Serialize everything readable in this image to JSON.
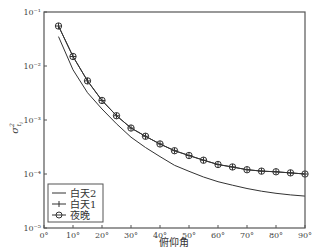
{
  "chart_data": {
    "type": "line",
    "title": "",
    "xlabel": "俯仰角",
    "ylabel": "σ²_{t_i}",
    "yscale": "log",
    "xlim": [
      0,
      90
    ],
    "ylim": [
      1e-05,
      0.1
    ],
    "x_ticks": [
      0,
      10,
      20,
      30,
      40,
      50,
      60,
      70,
      80,
      90
    ],
    "x_tick_labels": [
      "0°",
      "10°",
      "20°",
      "30°",
      "40°",
      "50°",
      "60°",
      "70°",
      "80°",
      "90°"
    ],
    "y_ticks": [
      0.1,
      0.01,
      0.001,
      0.0001,
      1e-05
    ],
    "y_tick_labels": [
      "10⁻¹",
      "10⁻²",
      "10⁻³",
      "10⁻⁴",
      "10⁻⁵"
    ],
    "grid": false,
    "legend_position": "lower left",
    "x": [
      5,
      10,
      15,
      20,
      25,
      30,
      35,
      40,
      45,
      50,
      55,
      60,
      65,
      70,
      75,
      80,
      85,
      90
    ],
    "series": [
      {
        "name": "白天2",
        "marker": "none",
        "values": [
          0.035,
          0.0085,
          0.0032,
          0.0016,
          0.00085,
          0.00048,
          0.00031,
          0.00021,
          0.000145,
          0.000112,
          8.8e-05,
          7.2e-05,
          6.2e-05,
          5.4e-05,
          4.8e-05,
          4.4e-05,
          4.1e-05,
          3.9e-05
        ]
      },
      {
        "name": "白天1",
        "marker": "plus",
        "values": [
          0.055,
          0.015,
          0.0053,
          0.0023,
          0.0012,
          0.00071,
          0.0005,
          0.00036,
          0.00027,
          0.00022,
          0.00018,
          0.00015,
          0.000135,
          0.00012,
          0.000113,
          0.00011,
          0.000105,
          0.0001
        ]
      },
      {
        "name": "夜晚",
        "marker": "circle",
        "values": [
          0.055,
          0.015,
          0.0053,
          0.0023,
          0.0012,
          0.00071,
          0.0005,
          0.00036,
          0.00027,
          0.00022,
          0.00018,
          0.00015,
          0.000135,
          0.00012,
          0.000113,
          0.00011,
          0.000105,
          0.0001
        ]
      }
    ]
  },
  "legend": {
    "items": [
      {
        "label": "白天2",
        "symbol": "line"
      },
      {
        "label": "白天1",
        "symbol": "plus"
      },
      {
        "label": "夜晚",
        "symbol": "circle"
      }
    ]
  },
  "axes": {
    "xlabel": "俯仰角",
    "ylabel_base": "σ",
    "ylabel_sup": "2",
    "ylabel_sub": "t",
    "ylabel_subsub": "i"
  },
  "colors": {
    "line": "#333333",
    "axis": "#555555",
    "background": "#ffffff"
  }
}
